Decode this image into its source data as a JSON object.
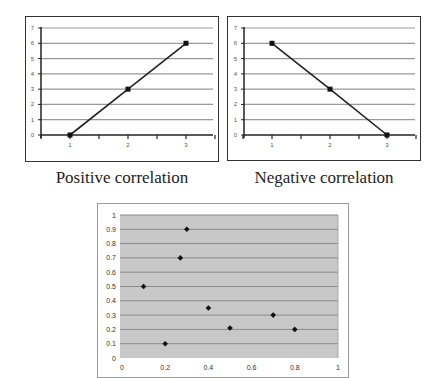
{
  "chart_data": [
    {
      "type": "line",
      "title": "Positive correlation",
      "x": [
        1,
        2,
        3
      ],
      "series": [
        {
          "name": "series1",
          "values": [
            0,
            3,
            6
          ]
        }
      ],
      "xticks": [
        "1",
        "2",
        "3"
      ],
      "yticks": [
        "0",
        "1",
        "2",
        "3",
        "4",
        "5",
        "6",
        "7"
      ],
      "ylim": [
        0,
        7
      ],
      "grid": true,
      "legend": null
    },
    {
      "type": "line",
      "title": "Negative correlation",
      "x": [
        1,
        2,
        3
      ],
      "series": [
        {
          "name": "series1",
          "values": [
            6,
            3,
            0
          ]
        }
      ],
      "xticks": [
        "1",
        "2",
        "3"
      ],
      "yticks": [
        "0",
        "1",
        "2",
        "3",
        "4",
        "5",
        "6",
        "7"
      ],
      "ylim": [
        0,
        7
      ],
      "grid": true,
      "legend": null
    },
    {
      "type": "scatter",
      "title": "",
      "x": [
        0.1,
        0.2,
        0.27,
        0.3,
        0.4,
        0.5,
        0.7,
        0.8
      ],
      "y": [
        0.5,
        0.1,
        0.7,
        0.9,
        0.35,
        0.21,
        0.3,
        0.2
      ],
      "xticks": [
        "0",
        "0.2",
        "0.4",
        "0.6",
        "0.8",
        "1"
      ],
      "yticks": [
        "0",
        "0.1",
        "0.2",
        "0.3",
        "0.4",
        "0.5",
        "0.6",
        "0.7",
        "0.8",
        "0.9",
        "1"
      ],
      "xlim": [
        0,
        1
      ],
      "ylim": [
        0,
        1
      ],
      "grid": true,
      "legend": null
    }
  ],
  "captions": {
    "left": "Positive correlation",
    "right": "Negative correlation"
  }
}
